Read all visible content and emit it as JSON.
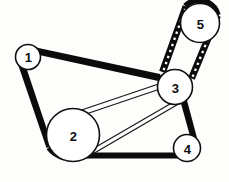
{
  "diagram": {
    "type": "pulley-belt-routing",
    "width": 229,
    "height": 182,
    "background_color": "#fdfdfb",
    "belt_color": "#0b0b0b",
    "pulley_fill": "#ffffff",
    "pulley_stroke": "#101010",
    "label_color": "#0d0d0d"
  },
  "pulleys": [
    {
      "id": "1",
      "label": "1",
      "cx": 28,
      "cy": 57,
      "r": 12.5
    },
    {
      "id": "2",
      "label": "2",
      "cx": 73,
      "cy": 135,
      "r": 26.5
    },
    {
      "id": "3",
      "label": "3",
      "cx": 175,
      "cy": 87,
      "r": 17.5
    },
    {
      "id": "4",
      "label": "4",
      "cx": 187,
      "cy": 148,
      "r": 13.5
    },
    {
      "id": "5",
      "label": "5",
      "cx": 200,
      "cy": 23,
      "r": 19.5
    }
  ],
  "belts": [
    {
      "id": "main-outer-belt",
      "name": "main-serpentine-belt",
      "style": "solid-thick",
      "path_pulleys": [
        "1",
        "3",
        "4",
        "2",
        "1"
      ],
      "stroke_width": 7
    },
    {
      "id": "inner-belt",
      "name": "inner-accessory-belt",
      "style": "thin-outline",
      "path_pulleys": [
        "2",
        "3"
      ],
      "stroke_width": 1.15
    },
    {
      "id": "toothed-belt",
      "name": "toothed-timing-belt",
      "style": "ribbed",
      "path_pulleys": [
        "3",
        "5"
      ],
      "stroke_width": 6.5,
      "tooth_count": 9
    }
  ]
}
